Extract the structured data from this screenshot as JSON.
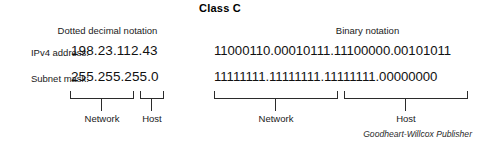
{
  "title": "Class C",
  "columns": {
    "decimal_heading": "Dotted decimal notation",
    "binary_heading": "Binary notation"
  },
  "rows": [
    {
      "label": "IPv4 address:",
      "decimal": "198.23.112.43",
      "binary": "11000110.00010111.11100000.00101011"
    },
    {
      "label": "Subnet mask:",
      "decimal": "255.255.255.0",
      "binary": "11111111.11111111.11111111.00000000"
    }
  ],
  "decimal_parts": {
    "network_label": "Network",
    "host_label": "Host"
  },
  "binary_parts": {
    "network_label": "Network",
    "host_label": "Host"
  },
  "credit": "Goodheart-Willcox Publisher",
  "colors": {
    "background": "#ffffff",
    "text": "#1a1a1a",
    "rule": "#2b2b2b"
  }
}
